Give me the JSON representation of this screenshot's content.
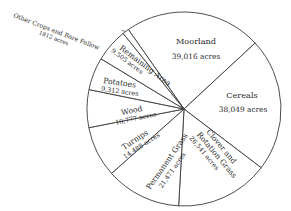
{
  "chart_data": {
    "type": "pie",
    "title": "",
    "unit": "acres",
    "start_direction": "slice boundaries begin upper-left of top, proceed clockwise",
    "slices": [
      {
        "name": "Moorland",
        "value": 39016,
        "value_label": "39,016 acres"
      },
      {
        "name": "Cereals",
        "value": 38049,
        "value_label": "38,049 acres"
      },
      {
        "name": "Clover and Rotation Grass",
        "value": 26541,
        "value_label": "26,541 acres"
      },
      {
        "name": "Permanent Grass",
        "value": 21471,
        "value_label": "21,471 acres"
      },
      {
        "name": "Turnips",
        "value": 14488,
        "value_label": "14,488 acres"
      },
      {
        "name": "Wood",
        "value": 10777,
        "value_label": "10,777 acres"
      },
      {
        "name": "Potatoes",
        "value": 9312,
        "value_label": "9,312 acres"
      },
      {
        "name": "Remaining Area",
        "value": 9505,
        "value_label": "9,505 acres"
      },
      {
        "name": "Other Crops and Bare Fallow",
        "value": 1812,
        "value_label": "1812 acres"
      }
    ],
    "legend": "none (labels inside slices; smallest slice labelled outside upper-left)"
  },
  "labels": {
    "moorland": {
      "name": "Moorland",
      "value": "39,016 acres"
    },
    "cereals": {
      "name": "Cereals",
      "value": "38,049 acres"
    },
    "clover": {
      "line1": "Clover and",
      "line2": "Rotation Grass",
      "value": "26,541 acres"
    },
    "permanent": {
      "name": "Permanent Grass",
      "value": "21,471 acres"
    },
    "turnips": {
      "name": "Turnips",
      "value": "14,488 acres"
    },
    "wood": {
      "name": "Wood",
      "value": "10,777 acres"
    },
    "potatoes": {
      "name": "Potatoes",
      "value": "9,312 acres"
    },
    "remaining": {
      "name": "Remaining Area",
      "value": "9,505 acres"
    },
    "other": {
      "name": "Other Crops and Bare Fallow",
      "value": "1812 acres"
    }
  }
}
